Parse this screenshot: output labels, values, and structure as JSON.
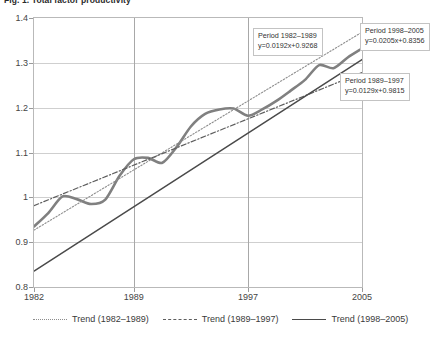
{
  "figure": {
    "title": "Fig. 1. Total factor productivity",
    "title_clipped": true
  },
  "chart_data": {
    "type": "line",
    "title": "Fig. 1. Total factor productivity",
    "xlabel": "",
    "ylabel": "",
    "xlim": [
      1982,
      2005
    ],
    "ylim": [
      0.8,
      1.4
    ],
    "grid": true,
    "legend_position": "bottom",
    "xticks": [
      1982,
      1989,
      1997,
      2005
    ],
    "xtick_labels": [
      "1982",
      "1989",
      "1997",
      "2005"
    ],
    "yticks": [
      0.8,
      0.9,
      1.0,
      1.1,
      1.2,
      1.3,
      1.4
    ],
    "ytick_labels": [
      "0.8",
      "0.9",
      "1",
      "1.1",
      "1.2",
      "1.3",
      "1.4"
    ],
    "x": [
      1982,
      1983,
      1984,
      1985,
      1986,
      1987,
      1988,
      1989,
      1990,
      1991,
      1992,
      1993,
      1994,
      1995,
      1996,
      1997,
      1998,
      1999,
      2000,
      2001,
      2002,
      2003,
      2004,
      2005
    ],
    "series": [
      {
        "name": "Total factor productivity",
        "style": "solid-thick",
        "color": "#808080",
        "values": [
          0.935,
          0.965,
          1.002,
          0.996,
          0.985,
          0.995,
          1.048,
          1.085,
          1.088,
          1.077,
          1.112,
          1.158,
          1.186,
          1.196,
          1.198,
          1.182,
          1.196,
          1.215,
          1.238,
          1.262,
          1.295,
          1.288,
          1.312,
          1.332
        ]
      },
      {
        "name": "Trend (1982–1989)",
        "style": "dotted",
        "color": "#8d8d8d",
        "equation": "y=0.0192x+0.9268",
        "slope": 0.0192,
        "intercept": 0.9268,
        "x_range": [
          1982,
          2005
        ]
      },
      {
        "name": "Trend (1989–1997)",
        "style": "dash-dot",
        "color": "#5e5e5e",
        "equation": "y=0.0129x+0.9815",
        "slope": 0.0129,
        "intercept": 0.9815,
        "x_range": [
          1982,
          2005
        ]
      },
      {
        "name": "Trend (1998–2005)",
        "style": "solid",
        "color": "#4a4a4a",
        "equation": "y=0.0205x+0.8356",
        "slope": 0.0205,
        "intercept": 0.8356,
        "x_range": [
          1982,
          2005
        ]
      }
    ],
    "annotations": [
      {
        "id": "ann-1982-1989",
        "period_label": "Period 1982–1989",
        "equation": "y=0.0192x+0.9268",
        "x_px": 253,
        "y_px": 28
      },
      {
        "id": "ann-1998-2005",
        "period_label": "Period 1998–2005",
        "equation": "y=0.0205x+0.8356",
        "x_px": 360,
        "y_px": 23
      },
      {
        "id": "ann-1989-1997",
        "period_label": "Period 1989–1997",
        "equation": "y=0.0129x+0.9815",
        "x_px": 340,
        "y_px": 73
      }
    ]
  },
  "legend": {
    "items": [
      {
        "label": "Trend (1982–1989)",
        "style": "dotted"
      },
      {
        "label": "Trend (1989–1997)",
        "style": "dash-dot"
      },
      {
        "label": "Trend (1998–2005)",
        "style": "solid"
      }
    ]
  }
}
